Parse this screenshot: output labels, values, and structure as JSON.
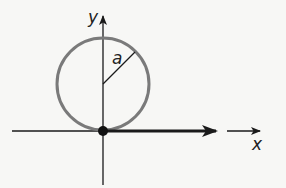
{
  "diagram": {
    "labels": {
      "y_axis": "y",
      "x_axis": "x",
      "radius": "a"
    },
    "colors": {
      "circle": "#7a7a7a",
      "axes": "#1a1a1a",
      "background": "#f7f7f5"
    }
  }
}
